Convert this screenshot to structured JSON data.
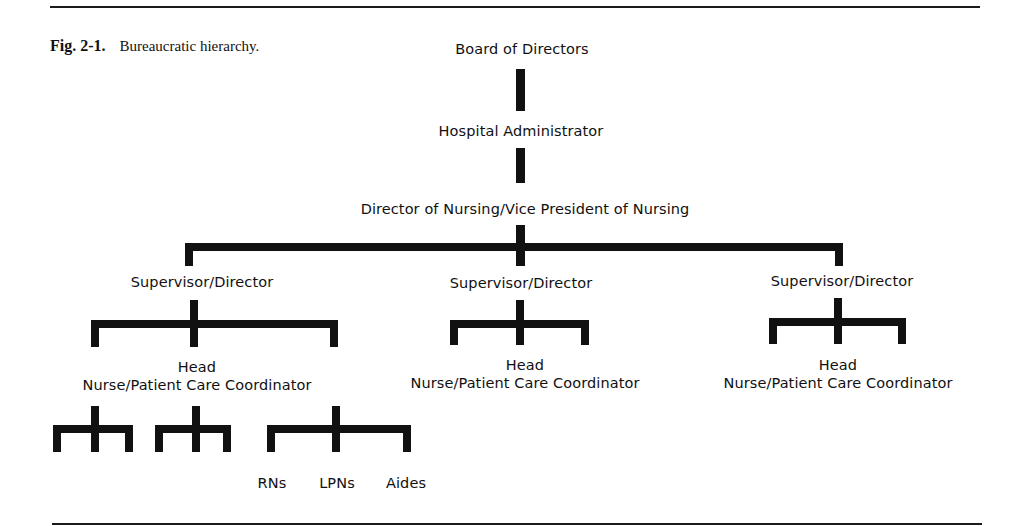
{
  "figure": {
    "number": "Fig. 2-1.",
    "caption": "Bureaucratic hierarchy."
  },
  "levels": {
    "board": "Board of Directors",
    "administrator": "Hospital Administrator",
    "director_of_nursing": "Director of Nursing/Vice President of Nursing",
    "supervisors": [
      {
        "label": "Supervisor/Director"
      },
      {
        "label": "Supervisor/Director"
      },
      {
        "label": "Supervisor/Director"
      }
    ],
    "head_nurses": [
      {
        "line1": "Head",
        "line2": "Nurse/Patient Care Coordinator"
      },
      {
        "line1": "Head",
        "line2": "Nurse/Patient Care Coordinator"
      },
      {
        "line1": "Head",
        "line2": "Nurse/Patient Care Coordinator"
      }
    ],
    "staff": [
      {
        "label": "RNs"
      },
      {
        "label": "LPNs"
      },
      {
        "label": "Aides"
      }
    ]
  },
  "colors": {
    "ink": "#111111",
    "background": "#ffffff"
  }
}
